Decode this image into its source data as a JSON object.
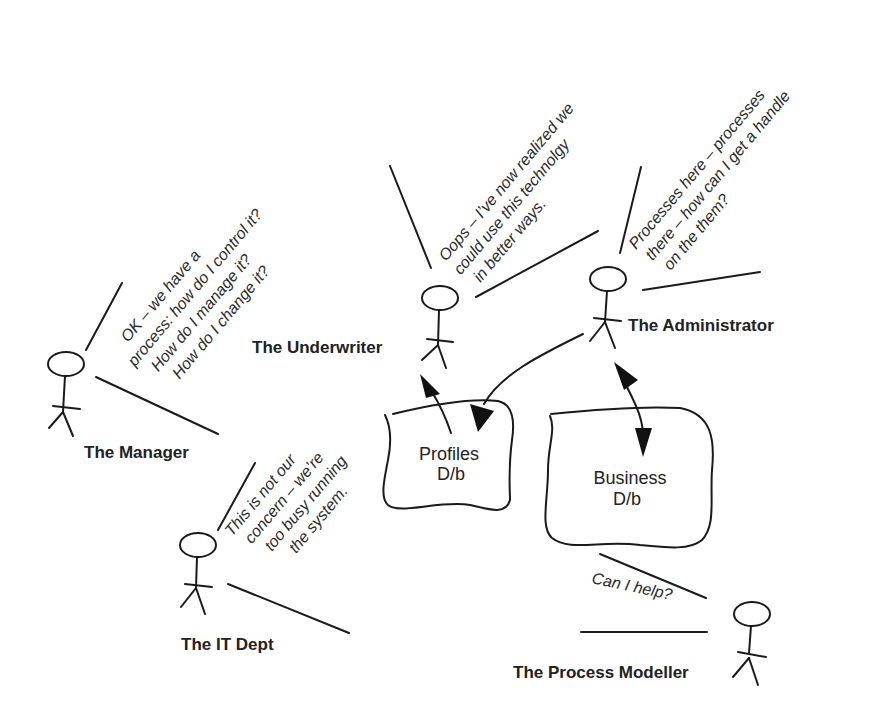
{
  "diagram": {
    "actors": [
      {
        "id": "manager",
        "label": "The Manager",
        "speech": [
          "OK  – we have a",
          "process: how do I control it?",
          "How do I manage it?",
          "How do I change it?"
        ]
      },
      {
        "id": "underwriter",
        "label": "The Underwriter",
        "speech": [
          "Oops  – I’ve now realized we",
          "could use this technolgy",
          "in better ways."
        ]
      },
      {
        "id": "administrator",
        "label": "The Administrator",
        "speech": [
          "Processes here  – processes",
          "there  – how can I get a handle",
          "on the them?"
        ]
      },
      {
        "id": "it-dept",
        "label": "The IT Dept",
        "speech": [
          "This is not our",
          "concern  – we’re",
          "too busy running",
          "the system."
        ]
      },
      {
        "id": "process-modeller",
        "label": "The Process Modeller",
        "speech": [
          "Can I help?"
        ]
      }
    ],
    "databases": [
      {
        "id": "profiles-db",
        "lines": [
          "Profiles",
          "D/b"
        ]
      },
      {
        "id": "business-db",
        "lines": [
          "Business",
          "D/b"
        ]
      }
    ],
    "icons": {
      "actor": "stick-figure-icon",
      "database": "wavy-database-shape",
      "arrow": "filled-arrowhead"
    },
    "colors": {
      "ink": "#1a1a1a",
      "background": "#ffffff"
    }
  }
}
